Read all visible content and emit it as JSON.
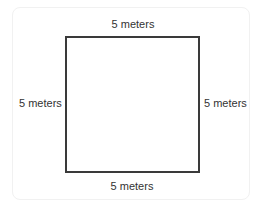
{
  "diagram": {
    "shape": "square",
    "side_length": 5,
    "unit": "meters",
    "labels": {
      "top": "5 meters",
      "left": "5 meters",
      "right": "5 meters",
      "bottom": "5 meters"
    },
    "colors": {
      "stroke": "#3a3a3a",
      "text": "#333333",
      "background": "#ffffff",
      "card_border": "#f1f1f1"
    }
  }
}
